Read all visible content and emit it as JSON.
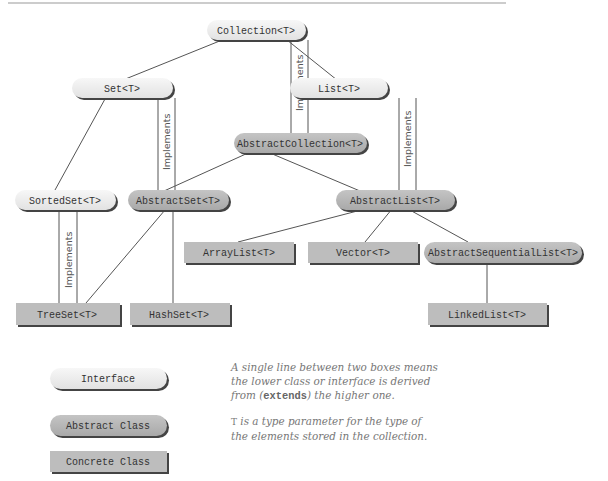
{
  "colors": {
    "interface_fill": "#ececec",
    "abstract_fill": "#b4b4b4",
    "concrete_fill": "#bdbdbd",
    "shadow": "#444444",
    "edge": "#555555",
    "top_rule": "#999999"
  },
  "nodes": {
    "collection": {
      "label": "Collection<T>",
      "kind": "interface"
    },
    "set": {
      "label": "Set<T>",
      "kind": "interface"
    },
    "list": {
      "label": "List<T>",
      "kind": "interface"
    },
    "abstract_collection": {
      "label": "AbstractCollection<T>",
      "kind": "abstract"
    },
    "sorted_set": {
      "label": "SortedSet<T>",
      "kind": "interface"
    },
    "abstract_set": {
      "label": "AbstractSet<T>",
      "kind": "abstract"
    },
    "abstract_list": {
      "label": "AbstractList<T>",
      "kind": "abstract"
    },
    "array_list": {
      "label": "ArrayList<T>",
      "kind": "concrete"
    },
    "vector": {
      "label": "Vector<T>",
      "kind": "concrete"
    },
    "abstract_sequential_list": {
      "label": "AbstractSequentialList<T>",
      "kind": "abstract"
    },
    "tree_set": {
      "label": "TreeSet<T>",
      "kind": "concrete"
    },
    "hash_set": {
      "label": "HashSet<T>",
      "kind": "concrete"
    },
    "linked_list": {
      "label": "LinkedList<T>",
      "kind": "concrete"
    }
  },
  "edges": {
    "extends": [
      [
        "Set<T>",
        "Collection<T>"
      ],
      [
        "List<T>",
        "Collection<T>"
      ],
      [
        "SortedSet<T>",
        "Set<T>"
      ],
      [
        "AbstractSet<T>",
        "AbstractCollection<T>"
      ],
      [
        "AbstractList<T>",
        "AbstractCollection<T>"
      ],
      [
        "ArrayList<T>",
        "AbstractList<T>"
      ],
      [
        "Vector<T>",
        "AbstractList<T>"
      ],
      [
        "AbstractSequentialList<T>",
        "AbstractList<T>"
      ],
      [
        "TreeSet<T>",
        "AbstractSet<T>"
      ],
      [
        "HashSet<T>",
        "AbstractSet<T>"
      ],
      [
        "LinkedList<T>",
        "AbstractSequentialList<T>"
      ]
    ],
    "implements": [
      [
        "AbstractCollection<T>",
        "Collection<T>"
      ],
      [
        "AbstractSet<T>",
        "Set<T>"
      ],
      [
        "AbstractList<T>",
        "List<T>"
      ],
      [
        "TreeSet<T>",
        "SortedSet<T>"
      ]
    ],
    "implements_label": "Implements"
  },
  "legend": {
    "interface": "Interface",
    "abstract_class": "Abstract Class",
    "concrete_class": "Concrete Class"
  },
  "notes": {
    "line1": "A single line between two boxes means",
    "line2": "the lower class or interface is derived",
    "line3_pre": "from (",
    "line3_code": "extends",
    "line3_post": ") the higher one.",
    "t_var": "T",
    "t_line1_post": " is a type parameter for the type of",
    "t_line2": "the elements stored in the collection."
  }
}
